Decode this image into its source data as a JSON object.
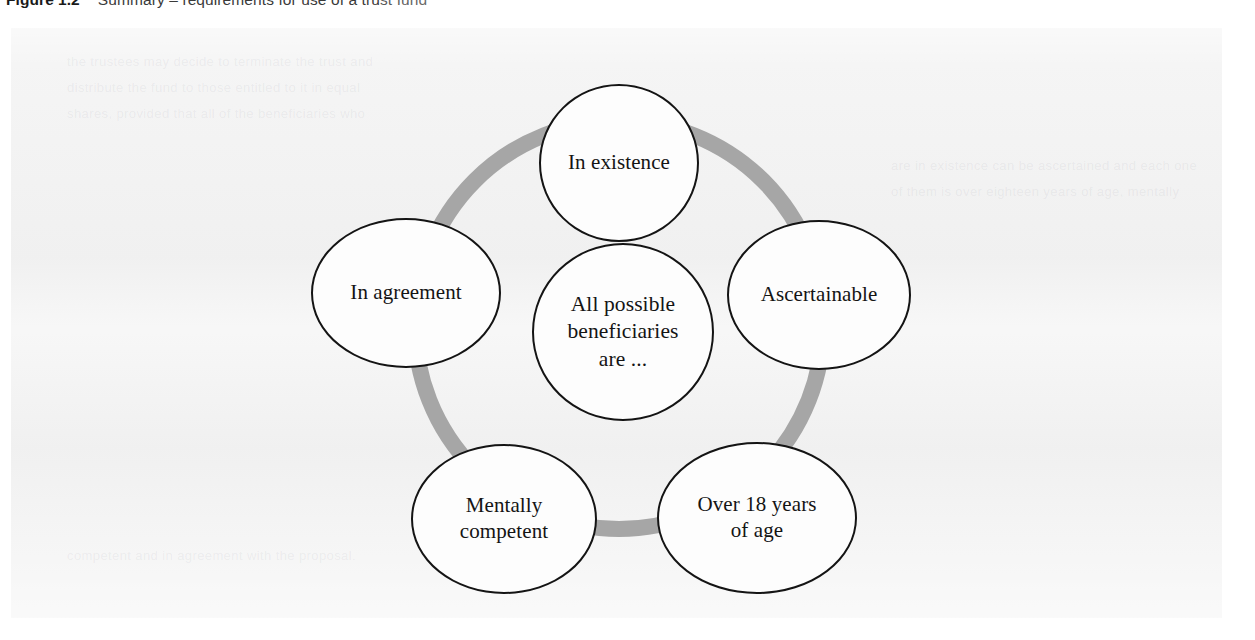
{
  "caption": {
    "label": "Figure",
    "number": "1.2",
    "text": "Summary – requirements for use of a trust fund"
  },
  "figure": {
    "title": "All possible beneficiaries are ...",
    "ring_color": "#a6a6a6",
    "node_border_color": "#141414",
    "node_fill_color": "#fdfdfd",
    "panel_background": "#f3f3f3",
    "center_node": {
      "id": "center",
      "lines": [
        "All possible",
        "beneficiaries",
        "are ..."
      ]
    },
    "nodes": [
      {
        "id": "in-existence",
        "lines": [
          "In existence"
        ]
      },
      {
        "id": "ascertainable",
        "lines": [
          "Ascertainable"
        ]
      },
      {
        "id": "over-18",
        "lines": [
          "Over 18 years",
          "of age"
        ]
      },
      {
        "id": "mentally-competent",
        "lines": [
          "Mentally",
          "competent"
        ]
      },
      {
        "id": "in-agreement",
        "lines": [
          "In agreement"
        ]
      }
    ]
  },
  "ghost_text": {
    "lines": [
      "the trustees may decide to terminate the trust and",
      "distribute the fund to those entitled to it in equal",
      "shares, provided that all of the beneficiaries who",
      "are in existence can be ascertained and each one",
      "of them is over eighteen years of age, mentally",
      "competent and in agreement with the proposal."
    ]
  }
}
